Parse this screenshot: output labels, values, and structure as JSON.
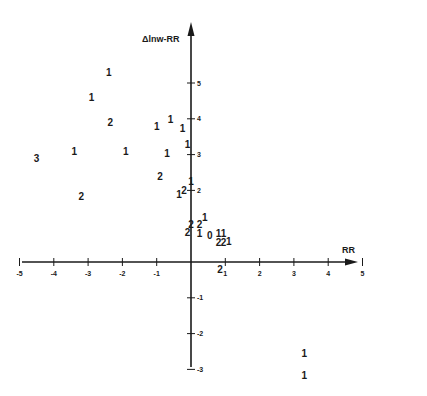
{
  "chart_data": {
    "type": "scatter",
    "title": "",
    "xlabel": "RR",
    "ylabel": "Δlnw-RR",
    "xlim": [
      -5,
      5.8
    ],
    "ylim": [
      -3,
      6.2
    ],
    "grid": false,
    "legend": "none",
    "x_ticks": [
      "-5",
      "-4",
      "-3",
      "-2",
      "-1",
      "1",
      "2",
      "3",
      "4",
      "5"
    ],
    "x_tick_values": [
      -5,
      -4,
      -3,
      -2,
      -1,
      1,
      2,
      3,
      4,
      5
    ],
    "y_ticks": [
      "5",
      "4",
      "3",
      "2",
      "-1",
      "-2",
      "-3"
    ],
    "y_tick_values": [
      5,
      4,
      3,
      2,
      -1,
      -2,
      -3
    ],
    "marker_note": "Points are plotted as numerals indicating count of observations at that location",
    "points": [
      {
        "x": -2.4,
        "y": 5.3,
        "label": "1"
      },
      {
        "x": -2.9,
        "y": 4.6,
        "label": "1"
      },
      {
        "x": -2.35,
        "y": 3.9,
        "label": "2"
      },
      {
        "x": -0.6,
        "y": 4.0,
        "label": "1"
      },
      {
        "x": -1.0,
        "y": 3.8,
        "label": "1"
      },
      {
        "x": -0.25,
        "y": 3.75,
        "label": "1"
      },
      {
        "x": -0.1,
        "y": 3.3,
        "label": "1"
      },
      {
        "x": -4.5,
        "y": 2.9,
        "label": "3"
      },
      {
        "x": -3.4,
        "y": 3.1,
        "label": "1"
      },
      {
        "x": -1.9,
        "y": 3.1,
        "label": "1"
      },
      {
        "x": -0.7,
        "y": 3.05,
        "label": "1"
      },
      {
        "x": -0.9,
        "y": 2.4,
        "label": "2"
      },
      {
        "x": 0.0,
        "y": 2.25,
        "label": "1"
      },
      {
        "x": -0.2,
        "y": 2.0,
        "label": "2"
      },
      {
        "x": -0.35,
        "y": 1.9,
        "label": "1"
      },
      {
        "x": -3.2,
        "y": 1.85,
        "label": "2"
      },
      {
        "x": 0.4,
        "y": 1.25,
        "label": "1"
      },
      {
        "x": 0.25,
        "y": 1.05,
        "label": "2"
      },
      {
        "x": 0.0,
        "y": 1.05,
        "label": "2"
      },
      {
        "x": -0.1,
        "y": 0.85,
        "label": "2"
      },
      {
        "x": 0.25,
        "y": 0.8,
        "label": "1"
      },
      {
        "x": 0.55,
        "y": 0.75,
        "label": "0"
      },
      {
        "x": 0.8,
        "y": 0.8,
        "label": "1"
      },
      {
        "x": 0.95,
        "y": 0.8,
        "label": "1"
      },
      {
        "x": 0.8,
        "y": 0.55,
        "label": "2"
      },
      {
        "x": 0.95,
        "y": 0.55,
        "label": "2"
      },
      {
        "x": 1.1,
        "y": 0.6,
        "label": "1"
      },
      {
        "x": 0.85,
        "y": -0.2,
        "label": "2"
      },
      {
        "x": 3.3,
        "y": -2.55,
        "label": "1"
      },
      {
        "x": 3.3,
        "y": -3.15,
        "label": "1"
      }
    ]
  },
  "axes": {
    "x_title": "RR",
    "y_title": "Δlnw-RR"
  }
}
